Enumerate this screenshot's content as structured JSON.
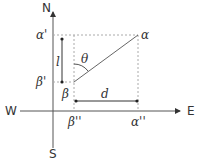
{
  "diagram": {
    "compass": {
      "north": "N",
      "south": "S",
      "west": "W",
      "east": "E"
    },
    "points": {
      "alpha": "α",
      "beta": "β",
      "alpha_prime": "α'",
      "beta_prime": "β'",
      "alpha_double_prime": "α''",
      "beta_double_prime": "β''"
    },
    "measures": {
      "length": "l",
      "distance": "d",
      "angle": "θ"
    },
    "colors": {
      "line": "#555555",
      "dotted": "#aaaaaa",
      "text": "#333333"
    }
  }
}
